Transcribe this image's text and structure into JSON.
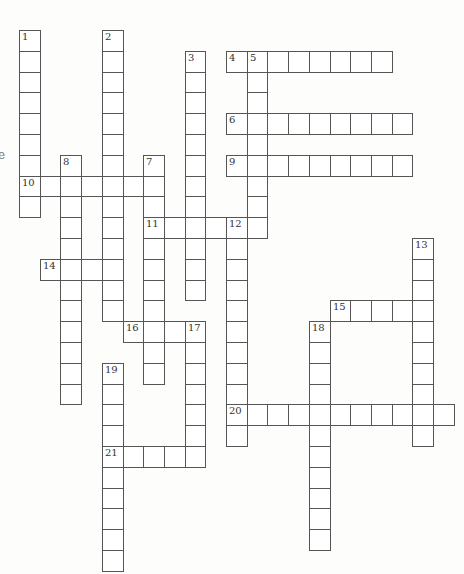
{
  "puzzle": {
    "grid": {
      "origin_x": 19,
      "origin_y": 30,
      "cell_w": 20.7,
      "cell_h": 20.8
    },
    "words": [
      {
        "number": "1",
        "dir": "down",
        "row": 0,
        "col": 0,
        "length": 9
      },
      {
        "number": "2",
        "dir": "down",
        "row": 0,
        "col": 4,
        "length": 14
      },
      {
        "number": "3",
        "dir": "down",
        "row": 1,
        "col": 8,
        "length": 12
      },
      {
        "number": "4",
        "dir": "across",
        "row": 1,
        "col": 10,
        "length": 8
      },
      {
        "number": "5",
        "dir": "down",
        "row": 1,
        "col": 11,
        "length": 9
      },
      {
        "number": "6",
        "dir": "across",
        "row": 4,
        "col": 10,
        "length": 9
      },
      {
        "number": "7",
        "dir": "down",
        "row": 6,
        "col": 6,
        "length": 11
      },
      {
        "number": "8",
        "dir": "down",
        "row": 6,
        "col": 2,
        "length": 12
      },
      {
        "number": "9",
        "dir": "across",
        "row": 6,
        "col": 10,
        "length": 9
      },
      {
        "number": "10",
        "dir": "across",
        "row": 7,
        "col": 0,
        "length": 7
      },
      {
        "number": "11",
        "dir": "across",
        "row": 9,
        "col": 6,
        "length": 6
      },
      {
        "number": "12",
        "dir": "down",
        "row": 9,
        "col": 10,
        "length": 11
      },
      {
        "number": "13",
        "dir": "down",
        "row": 10,
        "col": 19,
        "length": 10
      },
      {
        "number": "14",
        "dir": "across",
        "row": 11,
        "col": 1,
        "length": 4
      },
      {
        "number": "15",
        "dir": "across",
        "row": 13,
        "col": 15,
        "length": 5
      },
      {
        "number": "16",
        "dir": "across",
        "row": 14,
        "col": 5,
        "length": 4
      },
      {
        "number": "17",
        "dir": "down",
        "row": 14,
        "col": 8,
        "length": 7
      },
      {
        "number": "18",
        "dir": "down",
        "row": 14,
        "col": 14,
        "length": 11
      },
      {
        "number": "19",
        "dir": "down",
        "row": 16,
        "col": 4,
        "length": 10
      },
      {
        "number": "20",
        "dir": "across",
        "row": 18,
        "col": 10,
        "length": 11
      },
      {
        "number": "21",
        "dir": "across",
        "row": 20,
        "col": 4,
        "length": 5
      }
    ]
  },
  "stray_text": "e"
}
